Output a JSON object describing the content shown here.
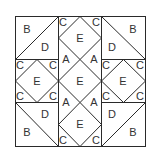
{
  "diagram": {
    "title": "",
    "type": "quilt-block",
    "grid": "3x3",
    "colors": {
      "line": "#2a2a2a",
      "text": "#333333",
      "background": "#ffffff"
    },
    "labels": {
      "top_left_b": "B",
      "top_left_d": "D",
      "top_center_c_left": "C",
      "top_center_c_right": "C",
      "top_center_e": "E",
      "top_right_b": "B",
      "top_right_d": "D",
      "center_a_top_left": "A",
      "center_a_top_right": "A",
      "center_e": "E",
      "center_a_bottom_left": "A",
      "center_a_bottom_right": "A",
      "mid_left_c_tl": "C",
      "mid_left_c_tr": "C",
      "mid_left_e": "E",
      "mid_left_c_bl": "C",
      "mid_left_c_br": "C",
      "mid_right_c_tl": "C",
      "mid_right_c_tr": "C",
      "mid_right_e": "E",
      "mid_right_c_bl": "C",
      "mid_right_c_br": "C",
      "bottom_left_d": "D",
      "bottom_left_b": "B",
      "bottom_center_e": "E",
      "bottom_center_c_left": "C",
      "bottom_center_c_right": "C",
      "bottom_right_d": "D",
      "bottom_right_b": "B"
    }
  }
}
